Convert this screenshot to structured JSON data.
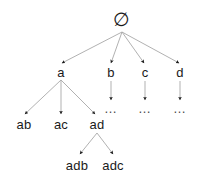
{
  "diagram": {
    "background_color": "#ffffff",
    "edge_color": "#a8a8a8",
    "arrowhead_color": "#1a1a1a",
    "text_color": "#1a1a1a",
    "nodes": [
      {
        "id": "root",
        "label": "∅",
        "x": 122,
        "y": 19,
        "kind": "root"
      },
      {
        "id": "a",
        "label": "a",
        "x": 61,
        "y": 72,
        "kind": "label"
      },
      {
        "id": "b",
        "label": "b",
        "x": 111,
        "y": 72,
        "kind": "label"
      },
      {
        "id": "c",
        "label": "c",
        "x": 145,
        "y": 72,
        "kind": "label"
      },
      {
        "id": "d",
        "label": "d",
        "x": 180,
        "y": 72,
        "kind": "label"
      },
      {
        "id": "ab",
        "label": "ab",
        "x": 24,
        "y": 124,
        "kind": "label"
      },
      {
        "id": "ac",
        "label": "ac",
        "x": 61,
        "y": 124,
        "kind": "label"
      },
      {
        "id": "ad",
        "label": "ad",
        "x": 97,
        "y": 124,
        "kind": "label"
      },
      {
        "id": "adb",
        "label": "adb",
        "x": 77,
        "y": 165,
        "kind": "label"
      },
      {
        "id": "adc",
        "label": "adc",
        "x": 113,
        "y": 165,
        "kind": "label"
      },
      {
        "id": "b-dots",
        "label": "…",
        "x": 111,
        "y": 108,
        "kind": "ellipsis"
      },
      {
        "id": "c-dots",
        "label": "…",
        "x": 145,
        "y": 108,
        "kind": "ellipsis"
      },
      {
        "id": "d-dots",
        "label": "…",
        "x": 180,
        "y": 108,
        "kind": "ellipsis"
      }
    ],
    "edges": [
      {
        "from": "root",
        "to": "a",
        "x1": 122,
        "y1": 32,
        "x2": 62,
        "y2": 63
      },
      {
        "from": "root",
        "to": "b",
        "x1": 122,
        "y1": 32,
        "x2": 111,
        "y2": 63
      },
      {
        "from": "root",
        "to": "c",
        "x1": 122,
        "y1": 32,
        "x2": 144,
        "y2": 63
      },
      {
        "from": "root",
        "to": "d",
        "x1": 122,
        "y1": 32,
        "x2": 179,
        "y2": 63
      },
      {
        "from": "a",
        "to": "ab",
        "x1": 61,
        "y1": 80,
        "x2": 25,
        "y2": 114
      },
      {
        "from": "a",
        "to": "ac",
        "x1": 61,
        "y1": 80,
        "x2": 61,
        "y2": 114
      },
      {
        "from": "a",
        "to": "ad",
        "x1": 61,
        "y1": 80,
        "x2": 95,
        "y2": 114
      },
      {
        "from": "ad",
        "to": "adb",
        "x1": 97,
        "y1": 133,
        "x2": 80,
        "y2": 154
      },
      {
        "from": "ad",
        "to": "adc",
        "x1": 97,
        "y1": 133,
        "x2": 113,
        "y2": 154
      },
      {
        "from": "b",
        "to": "b-dots",
        "x1": 111,
        "y1": 81,
        "x2": 111,
        "y2": 100
      },
      {
        "from": "c",
        "to": "c-dots",
        "x1": 145,
        "y1": 81,
        "x2": 145,
        "y2": 100
      },
      {
        "from": "d",
        "to": "d-dots",
        "x1": 180,
        "y1": 81,
        "x2": 180,
        "y2": 100
      }
    ]
  }
}
